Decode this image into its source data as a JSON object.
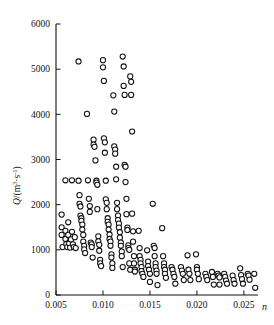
{
  "chart_data": {
    "type": "scatter",
    "title": "",
    "xlabel": "n",
    "ylabel": "Q/(m³·s⁻¹)",
    "ylabel_parts": {
      "quantity": "Q",
      "slash": "/",
      "open": "(",
      "unit_m": "m",
      "exp_m": "3",
      "dot": "·",
      "unit_s": "s",
      "exp_s": "-1",
      "close": ")"
    },
    "xlim": [
      0.005,
      0.0265
    ],
    "ylim": [
      0,
      6000
    ],
    "xticks": [
      0.005,
      0.01,
      0.015,
      0.02,
      0.025
    ],
    "xticklabels": [
      "0.005",
      "0.010",
      "0.015",
      "0.020",
      "0.025"
    ],
    "yticks": [
      0,
      1000,
      2000,
      3000,
      4000,
      5000,
      6000
    ],
    "yticklabels": [
      "0",
      "1000",
      "2000",
      "3000",
      "4000",
      "5000",
      "6000"
    ],
    "grid": false,
    "legend": null,
    "marker": {
      "shape": "circle",
      "filled": false,
      "edge_color": "#111111",
      "face_color": "#ffffff",
      "radius_px": 2.6
    },
    "points": [
      [
        0.0056,
        1780
      ],
      [
        0.0056,
        1500
      ],
      [
        0.0056,
        1330
      ],
      [
        0.0057,
        1060
      ],
      [
        0.006,
        2540
      ],
      [
        0.006,
        1420
      ],
      [
        0.006,
        1240
      ],
      [
        0.0061,
        1130
      ],
      [
        0.0062,
        1060
      ],
      [
        0.0063,
        1610
      ],
      [
        0.0063,
        1330
      ],
      [
        0.0064,
        1140
      ],
      [
        0.0065,
        1050
      ],
      [
        0.0066,
        1230
      ],
      [
        0.0067,
        2540
      ],
      [
        0.0067,
        1400
      ],
      [
        0.0068,
        1120
      ],
      [
        0.0069,
        1060
      ],
      [
        0.007,
        1280
      ],
      [
        0.0071,
        1040
      ],
      [
        0.0074,
        5170
      ],
      [
        0.0074,
        2530
      ],
      [
        0.0075,
        2210
      ],
      [
        0.0075,
        2020
      ],
      [
        0.0076,
        1960
      ],
      [
        0.0076,
        1760
      ],
      [
        0.0077,
        1700
      ],
      [
        0.0077,
        1640
      ],
      [
        0.0078,
        1560
      ],
      [
        0.0078,
        1450
      ],
      [
        0.0079,
        1330
      ],
      [
        0.0079,
        1180
      ],
      [
        0.008,
        1090
      ],
      [
        0.008,
        1010
      ],
      [
        0.0081,
        930
      ],
      [
        0.0083,
        4010
      ],
      [
        0.0084,
        2540
      ],
      [
        0.0085,
        2130
      ],
      [
        0.0086,
        1970
      ],
      [
        0.0086,
        1840
      ],
      [
        0.0087,
        1160
      ],
      [
        0.0088,
        1120
      ],
      [
        0.0088,
        1060
      ],
      [
        0.0089,
        830
      ],
      [
        0.009,
        3440
      ],
      [
        0.009,
        3330
      ],
      [
        0.0091,
        3280
      ],
      [
        0.0092,
        2980
      ],
      [
        0.0093,
        2530
      ],
      [
        0.0093,
        2490
      ],
      [
        0.0094,
        2440
      ],
      [
        0.0094,
        1900
      ],
      [
        0.0095,
        1300
      ],
      [
        0.0095,
        1190
      ],
      [
        0.0096,
        1110
      ],
      [
        0.0096,
        980
      ],
      [
        0.0097,
        780
      ],
      [
        0.0097,
        700
      ],
      [
        0.0098,
        640
      ],
      [
        0.01,
        5200
      ],
      [
        0.01,
        5040
      ],
      [
        0.0101,
        4740
      ],
      [
        0.0101,
        3470
      ],
      [
        0.0102,
        3380
      ],
      [
        0.0102,
        3150
      ],
      [
        0.0103,
        2530
      ],
      [
        0.0103,
        2120
      ],
      [
        0.0104,
        2040
      ],
      [
        0.0104,
        1900
      ],
      [
        0.0105,
        1700
      ],
      [
        0.0105,
        1620
      ],
      [
        0.0106,
        1560
      ],
      [
        0.0106,
        1450
      ],
      [
        0.0107,
        1340
      ],
      [
        0.0107,
        1240
      ],
      [
        0.0108,
        1180
      ],
      [
        0.0108,
        1090
      ],
      [
        0.0109,
        900
      ],
      [
        0.0109,
        830
      ],
      [
        0.011,
        700
      ],
      [
        0.011,
        600
      ],
      [
        0.0111,
        4420
      ],
      [
        0.0112,
        4060
      ],
      [
        0.0112,
        3290
      ],
      [
        0.0113,
        3220
      ],
      [
        0.0113,
        3130
      ],
      [
        0.0114,
        2840
      ],
      [
        0.0114,
        2560
      ],
      [
        0.0115,
        2040
      ],
      [
        0.0115,
        1900
      ],
      [
        0.0116,
        1760
      ],
      [
        0.0116,
        1660
      ],
      [
        0.0117,
        1580
      ],
      [
        0.0117,
        1490
      ],
      [
        0.0118,
        1390
      ],
      [
        0.0118,
        1270
      ],
      [
        0.0119,
        1160
      ],
      [
        0.0119,
        1090
      ],
      [
        0.012,
        960
      ],
      [
        0.012,
        860
      ],
      [
        0.0121,
        620
      ],
      [
        0.0121,
        5280
      ],
      [
        0.0122,
        5060
      ],
      [
        0.0122,
        4630
      ],
      [
        0.0123,
        4430
      ],
      [
        0.0123,
        2880
      ],
      [
        0.0124,
        2840
      ],
      [
        0.0124,
        2500
      ],
      [
        0.0125,
        2130
      ],
      [
        0.0125,
        1790
      ],
      [
        0.0126,
        1490
      ],
      [
        0.0126,
        1440
      ],
      [
        0.0127,
        1100
      ],
      [
        0.0127,
        1040
      ],
      [
        0.0128,
        1000
      ],
      [
        0.0128,
        700
      ],
      [
        0.0129,
        560
      ],
      [
        0.0129,
        4840
      ],
      [
        0.013,
        4720
      ],
      [
        0.013,
        4430
      ],
      [
        0.0131,
        3620
      ],
      [
        0.0131,
        1800
      ],
      [
        0.0132,
        1410
      ],
      [
        0.0132,
        1180
      ],
      [
        0.0133,
        860
      ],
      [
        0.0133,
        700
      ],
      [
        0.0134,
        560
      ],
      [
        0.0134,
        520
      ],
      [
        0.0138,
        1420
      ],
      [
        0.0139,
        1040
      ],
      [
        0.0139,
        860
      ],
      [
        0.014,
        780
      ],
      [
        0.014,
        700
      ],
      [
        0.0141,
        620
      ],
      [
        0.0141,
        530
      ],
      [
        0.0142,
        470
      ],
      [
        0.0143,
        400
      ],
      [
        0.0147,
        990
      ],
      [
        0.0148,
        740
      ],
      [
        0.0148,
        640
      ],
      [
        0.0149,
        560
      ],
      [
        0.015,
        470
      ],
      [
        0.015,
        290
      ],
      [
        0.0153,
        2020
      ],
      [
        0.0154,
        1090
      ],
      [
        0.0155,
        1040
      ],
      [
        0.0155,
        860
      ],
      [
        0.0156,
        700
      ],
      [
        0.0156,
        620
      ],
      [
        0.0157,
        540
      ],
      [
        0.0157,
        470
      ],
      [
        0.0158,
        220
      ],
      [
        0.0163,
        1480
      ],
      [
        0.0164,
        860
      ],
      [
        0.0165,
        700
      ],
      [
        0.0165,
        620
      ],
      [
        0.0166,
        560
      ],
      [
        0.0166,
        470
      ],
      [
        0.0167,
        380
      ],
      [
        0.0173,
        620
      ],
      [
        0.0174,
        560
      ],
      [
        0.0175,
        470
      ],
      [
        0.0176,
        400
      ],
      [
        0.0177,
        250
      ],
      [
        0.0183,
        620
      ],
      [
        0.0184,
        540
      ],
      [
        0.0185,
        470
      ],
      [
        0.0186,
        330
      ],
      [
        0.019,
        880
      ],
      [
        0.0191,
        560
      ],
      [
        0.0192,
        470
      ],
      [
        0.0193,
        330
      ],
      [
        0.0199,
        900
      ],
      [
        0.02,
        620
      ],
      [
        0.02,
        560
      ],
      [
        0.0201,
        470
      ],
      [
        0.0202,
        350
      ],
      [
        0.0209,
        470
      ],
      [
        0.021,
        400
      ],
      [
        0.0211,
        330
      ],
      [
        0.0216,
        510
      ],
      [
        0.0217,
        400
      ],
      [
        0.0218,
        230
      ],
      [
        0.0222,
        470
      ],
      [
        0.0223,
        430
      ],
      [
        0.0224,
        390
      ],
      [
        0.0224,
        230
      ],
      [
        0.0229,
        470
      ],
      [
        0.023,
        400
      ],
      [
        0.0231,
        320
      ],
      [
        0.0232,
        250
      ],
      [
        0.0238,
        430
      ],
      [
        0.0239,
        330
      ],
      [
        0.024,
        250
      ],
      [
        0.0246,
        590
      ],
      [
        0.0247,
        440
      ],
      [
        0.0248,
        350
      ],
      [
        0.0249,
        250
      ],
      [
        0.0254,
        470
      ],
      [
        0.0255,
        430
      ],
      [
        0.0256,
        340
      ],
      [
        0.0261,
        470
      ],
      [
        0.0262,
        160
      ]
    ]
  },
  "axes": {
    "tick_color": "#111111",
    "axis_color": "#111111"
  }
}
